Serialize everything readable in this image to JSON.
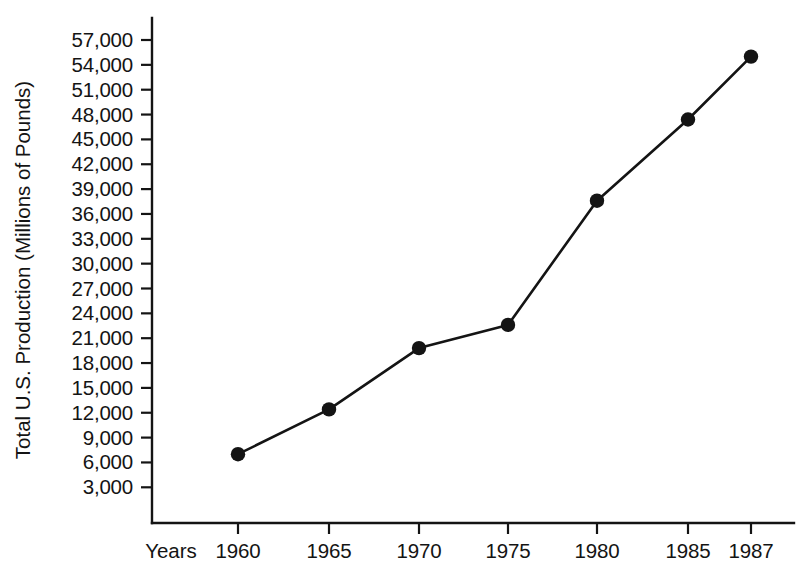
{
  "chart_data": {
    "type": "line",
    "title": "",
    "subtitle": "",
    "xlabel": "Years",
    "ylabel": "Total U.S. Production (Millions of Pounds)",
    "x": [
      1960,
      1965,
      1970,
      1975,
      1980,
      1985,
      1987
    ],
    "categories": [
      "1960",
      "1965",
      "1970",
      "1975",
      "1980",
      "1985",
      "1987"
    ],
    "values": [
      7000,
      12400,
      19800,
      22600,
      37600,
      47400,
      55000
    ],
    "series": [
      {
        "name": "Total U.S. Production",
        "values": [
          7000,
          12400,
          19800,
          22600,
          37600,
          47400,
          55000
        ]
      }
    ],
    "ylim": [
      0,
      58500
    ],
    "xlim": [
      1957.5,
      1989.5
    ],
    "ytick_values": [
      3000,
      6000,
      9000,
      12000,
      15000,
      18000,
      21000,
      24000,
      27000,
      30000,
      33000,
      36000,
      39000,
      42000,
      45000,
      48000,
      51000,
      54000,
      57000
    ],
    "ytick_labels": [
      "3,000",
      "6,000",
      "9,000",
      "12,000",
      "15,000",
      "18,000",
      "21,000",
      "24,000",
      "27,000",
      "30,000",
      "33,000",
      "36,000",
      "39,000",
      "42,000",
      "45,000",
      "48,000",
      "51,000",
      "54,000",
      "57,000"
    ],
    "xtick_labels": [
      "1960",
      "1965",
      "1970",
      "1975",
      "1980",
      "1985",
      "1987"
    ],
    "grid": false,
    "legend": false,
    "legend_position": "none",
    "marker": "filled-circle",
    "line_color": "#141414",
    "marker_color": "#141414",
    "background_color": "#ffffff",
    "annotations": []
  }
}
